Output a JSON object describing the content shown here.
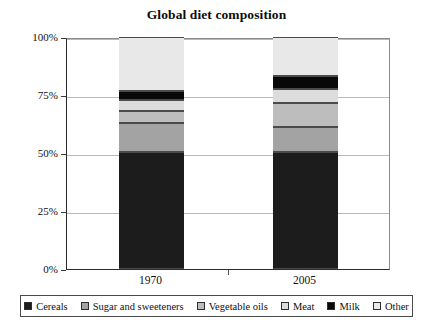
{
  "chart_data": {
    "type": "bar",
    "title": "Global diet composition",
    "subtitle": "",
    "xlabel": "",
    "ylabel": "",
    "stacked": true,
    "categories": [
      "1970",
      "2005"
    ],
    "ylim": [
      0,
      100
    ],
    "y_ticks": [
      "0%",
      "25%",
      "50%",
      "75%",
      "100%"
    ],
    "y_tick_values": [
      0,
      25,
      50,
      75,
      100
    ],
    "grid": true,
    "legend_position": "bottom",
    "series": [
      {
        "name": "Cereals",
        "color": "#1c1c1c",
        "values": [
          50.5,
          50.5
        ]
      },
      {
        "name": "Sugar and sweeteners",
        "color": "#a3a3a3",
        "values": [
          12.5,
          10.8
        ]
      },
      {
        "name": "Vegetable oils",
        "color": "#bdbdbd",
        "values": [
          5.2,
          10.3
        ]
      },
      {
        "name": "Meat",
        "color": "#dcdcdc",
        "values": [
          4.7,
          6.0
        ]
      },
      {
        "name": "Milk",
        "color": "#080808",
        "values": [
          3.9,
          5.6
        ]
      },
      {
        "name": "Other",
        "color": "#e8e8e8",
        "values": [
          23.2,
          16.8
        ]
      }
    ]
  },
  "legend": {
    "items": [
      {
        "label": "Cereals",
        "color": "#1c1c1c"
      },
      {
        "label": "Sugar and sweeteners",
        "color": "#a3a3a3"
      },
      {
        "label": "Vegetable oils",
        "color": "#bdbdbd"
      },
      {
        "label": "Meat",
        "color": "#dcdcdc"
      },
      {
        "label": "Milk",
        "color": "#080808"
      },
      {
        "label": "Other",
        "color": "#e8e8e8"
      }
    ]
  }
}
